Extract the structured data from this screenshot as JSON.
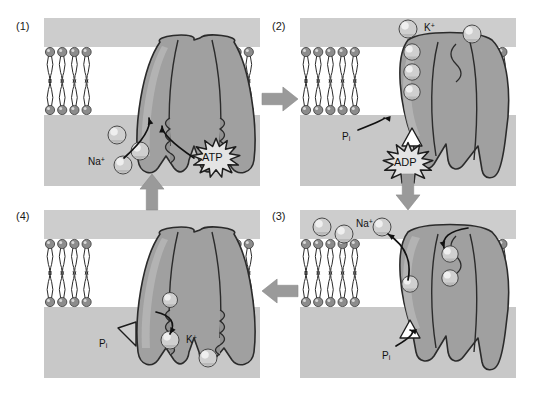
{
  "figure": {
    "type": "diagram",
    "background_color": "#ffffff",
    "panel_background_color": "#c8c8c8",
    "membrane_band_color": "#ffffff",
    "lipid_head_color": "#8c8c8c",
    "protein_color": "#a0a0a0",
    "ion_color": "#cfcfcf",
    "arrow_color": "#9a9a9a",
    "ink_color": "#111111"
  },
  "panels": [
    {
      "id": "panel-1",
      "number": "(1)",
      "x": 44,
      "y": 18,
      "w": 216,
      "h": 168,
      "state_description": "Three cytoplasmic Na+ ions and ATP bind to the pump",
      "ions": [
        {
          "name": "sodium-ion",
          "label": "",
          "cx": 73,
          "cy": 117,
          "r": 9,
          "side": "cytoplasm"
        },
        {
          "name": "sodium-ion",
          "label": "",
          "cx": 96,
          "cy": 133,
          "r": 9,
          "side": "cytoplasm"
        },
        {
          "name": "sodium-ion",
          "label": "",
          "cx": 79,
          "cy": 147,
          "r": 9,
          "side": "cytoplasm"
        }
      ],
      "labels": [
        {
          "name": "na-label",
          "text": "Na",
          "sup": "+",
          "x": 44,
          "y": 138
        },
        {
          "name": "atp-burst-label",
          "text": "ATP",
          "x": 152,
          "y": 126
        }
      ],
      "bursts": [
        {
          "name": "atp-burst",
          "text": "ATP",
          "cx": 172,
          "cy": 140,
          "r": 24
        }
      ],
      "hook_arrows": [
        {
          "name": "na-binding-arrow",
          "from": [
            80,
            140
          ],
          "to": [
            105,
            100
          ]
        },
        {
          "name": "atp-binding-arrow",
          "from": [
            150,
            140
          ],
          "to": [
            118,
            108
          ]
        }
      ]
    },
    {
      "id": "panel-2",
      "number": "(2)",
      "x": 300,
      "y": 18,
      "w": 216,
      "h": 168,
      "state_description": "ATP is hydrolysed to ADP; the pump is phosphorylated and changes shape, releasing Na+ outside",
      "ions": [
        {
          "name": "potassium-ion",
          "label": "K+",
          "cx": 108,
          "cy": 11,
          "r": 9,
          "side": "extracellular"
        },
        {
          "name": "potassium-ion",
          "label": "",
          "cx": 172,
          "cy": 16,
          "r": 9,
          "side": "extracellular"
        }
      ],
      "labels": [
        {
          "name": "k-label",
          "text": "K",
          "sup": "+",
          "x": 124,
          "y": 4
        },
        {
          "name": "pi-label",
          "text": "P",
          "sub": "i",
          "x": 42,
          "y": 113
        },
        {
          "name": "adp-burst-label",
          "text": "ADP",
          "x": 88,
          "y": 136
        }
      ],
      "bursts": [
        {
          "name": "adp-burst",
          "text": "ADP",
          "cx": 108,
          "cy": 145,
          "r": 25
        }
      ],
      "hook_arrows": [
        {
          "name": "pi-pointer-arrow",
          "from": [
            58,
            112
          ],
          "to": [
            84,
            100
          ]
        }
      ]
    },
    {
      "id": "panel-3",
      "number": "(3)",
      "x": 300,
      "y": 210,
      "w": 216,
      "h": 168,
      "state_description": "Na+ is released to the outside and two extracellular K+ ions bind to the phosphorylated pump",
      "ions": [
        {
          "name": "sodium-ion",
          "label": "",
          "cx": 22,
          "cy": 17,
          "r": 9,
          "side": "extracellular"
        },
        {
          "name": "sodium-ion",
          "label": "",
          "cx": 44,
          "cy": 24,
          "r": 9,
          "side": "extracellular"
        },
        {
          "name": "sodium-ion",
          "label": "",
          "cx": 82,
          "cy": 17,
          "r": 9,
          "side": "extracellular"
        }
      ],
      "labels": [
        {
          "name": "na-label",
          "text": "Na",
          "sup": "+",
          "x": 56,
          "y": 8
        },
        {
          "name": "pi-label",
          "text": "P",
          "sub": "i",
          "x": 82,
          "y": 140
        }
      ],
      "bursts": [],
      "hook_arrows": [
        {
          "name": "na-release-arrow",
          "from": [
            108,
            70
          ],
          "to": [
            88,
            24
          ]
        },
        {
          "name": "k-binding-arrow",
          "from": [
            168,
            18
          ],
          "to": [
            144,
            38
          ]
        },
        {
          "name": "pi-pointer-arrow",
          "from": [
            96,
            136
          ],
          "to": [
            110,
            120
          ]
        }
      ]
    },
    {
      "id": "panel-4",
      "number": "(4)",
      "x": 44,
      "y": 210,
      "w": 216,
      "h": 168,
      "state_description": "Loss of the phosphate group restores the original conformation and K+ is released into the cytoplasm",
      "ions": [
        {
          "name": "potassium-ion",
          "label": "K+",
          "cx": 126,
          "cy": 130,
          "r": 9,
          "side": "cytoplasm"
        },
        {
          "name": "potassium-ion",
          "label": "",
          "cx": 164,
          "cy": 148,
          "r": 9,
          "side": "cytoplasm"
        }
      ],
      "labels": [
        {
          "name": "pi-label",
          "text": "P",
          "sub": "i",
          "x": 55,
          "y": 128
        },
        {
          "name": "k-label",
          "text": "K",
          "sup": "+",
          "x": 142,
          "y": 124
        }
      ],
      "bursts": [],
      "hook_arrows": [
        {
          "name": "k-release-arrow",
          "from": [
            112,
            102
          ],
          "to": [
            126,
            124
          ]
        }
      ]
    }
  ],
  "flow_arrows": [
    {
      "name": "flow-arrow-1-to-2",
      "direction": "right",
      "x": 262,
      "y": 86,
      "w": 36,
      "h": 26
    },
    {
      "name": "flow-arrow-2-to-3",
      "direction": "down",
      "x": 395,
      "y": 174,
      "w": 26,
      "h": 36
    },
    {
      "name": "flow-arrow-3-to-4",
      "direction": "left",
      "x": 262,
      "y": 278,
      "w": 36,
      "h": 26
    },
    {
      "name": "flow-arrow-4-to-1",
      "direction": "up",
      "x": 139,
      "y": 174,
      "w": 26,
      "h": 36
    }
  ]
}
